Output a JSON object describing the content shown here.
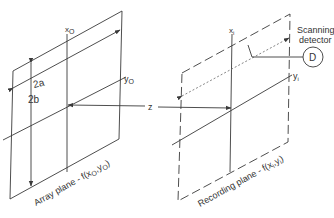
{
  "diagram": {
    "type": "optical-geometry",
    "colors": {
      "line": "#3a3a3a",
      "text": "#333333",
      "background": "#ffffff"
    },
    "array_plane": {
      "caption": "Array plane - f(x",
      "caption_sub1": "O",
      "caption_mid": ",y",
      "caption_sub2": "O",
      "caption_end": ")",
      "axis_x_label": "x",
      "axis_x_sub": "O",
      "axis_y_label": "y",
      "axis_y_sub": "O",
      "dim_width": "2a",
      "dim_height": "2b"
    },
    "z_axis_label": "z",
    "recording_plane": {
      "caption": "Recording plane - f(x",
      "caption_sub1": "i",
      "caption_mid": ",y",
      "caption_sub2": "i",
      "caption_end": ")",
      "axis_x_label": "x",
      "axis_x_sub": "i",
      "axis_y_label": "y",
      "axis_y_sub": "i"
    },
    "detector": {
      "label_line1": "Scanning",
      "label_line2": "detector",
      "symbol": "D"
    }
  }
}
